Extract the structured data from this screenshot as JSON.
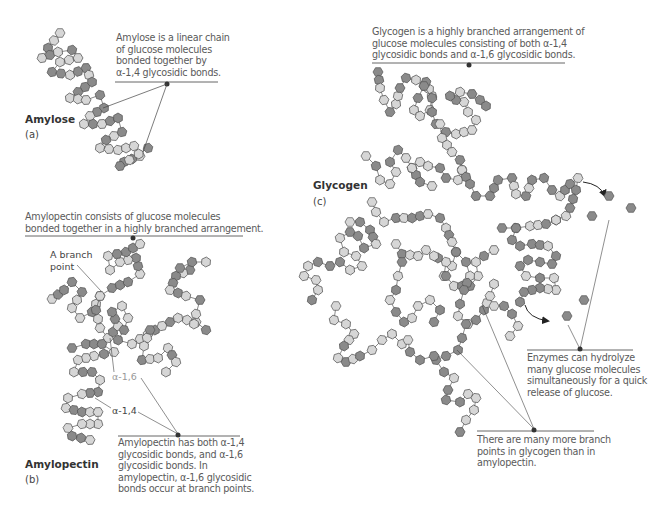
{
  "figure": {
    "panels": [
      {
        "id": "a",
        "name": "Amylose",
        "letter": "(a)",
        "caption": [
          "Amylose is a linear chain",
          "of glucose molecules",
          "bonded together by",
          "α-1,4 glycosidic bonds."
        ]
      },
      {
        "id": "b",
        "name": "Amylopectin",
        "letter": "(b)",
        "caption_top": [
          "Amylopectin consists of glucose molecules",
          "bonded together in a highly branched arrangement."
        ],
        "branch_label": [
          "A branch",
          "point"
        ],
        "bond_labels": {
          "a16": "α-1,6",
          "a14": "α-1,4"
        },
        "caption_bottom": [
          "Amylopectin has both α-1,4",
          "glycosidic bonds, and α-1,6",
          "glycosidic bonds. In",
          "amylopectin, α-1,6 glycosidic",
          "bonds occur at branch points."
        ]
      },
      {
        "id": "c",
        "name": "Glycogen",
        "letter": "(c)",
        "caption_top": [
          "Glycogen is a highly branched arrangement of",
          "glucose molecules consisting of both α-1,4",
          "glycosidic bonds and α-1,6 glycosidic bonds."
        ],
        "caption_enzymes": [
          "Enzymes can hydrolyze",
          "many glucose molecules",
          "simultaneously for a quick",
          "release of glucose."
        ],
        "caption_branch": [
          "There are many more branch",
          "points in glycogen than in",
          "amylopectin."
        ]
      }
    ],
    "colors": {
      "glucose_light": "#d6d6d6",
      "glucose_dark": "#8a8a8a",
      "outline": "#555555",
      "leader": "#444444",
      "rule": "#555555"
    }
  }
}
